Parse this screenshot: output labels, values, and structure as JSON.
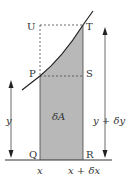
{
  "diagram": {
    "points": {
      "U": "U",
      "T": "T",
      "P": "P",
      "S": "S",
      "Q": "Q",
      "R": "R"
    },
    "area_label": "δA",
    "left_height_label": "y",
    "right_height_label": "y + δy",
    "x_label": "x",
    "x_plus_label": "x + δx",
    "colors": {
      "shade": "#b8b8b8",
      "line": "#222222"
    }
  }
}
